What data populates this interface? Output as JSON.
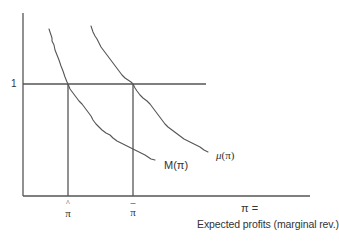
{
  "diagram": {
    "type": "economics-curve-diagram",
    "y_axis": {
      "tick_label": "1",
      "tick_value": 1
    },
    "x_axis": {
      "variable_label": "π =",
      "description": "Expected profits (marginal rev.)",
      "ticks": [
        {
          "id": "pi-hat",
          "symbol": "π",
          "accent": "^",
          "display": "π̂"
        },
        {
          "id": "pi-bar",
          "symbol": "π",
          "accent": "–",
          "display": "π̄"
        }
      ]
    },
    "curves": [
      {
        "id": "M",
        "label": "M(π)",
        "name": "M",
        "arg": "(π)",
        "shape": "downward-sloping",
        "crosses_one_at": "π̂"
      },
      {
        "id": "mu",
        "label": "μ(π)",
        "name": "μ",
        "arg": "(π)",
        "shape": "downward-sloping",
        "crosses_one_at": "π̄"
      }
    ],
    "colors": {
      "line": "#555555",
      "text": "#333333",
      "background": "#ffffff"
    }
  }
}
